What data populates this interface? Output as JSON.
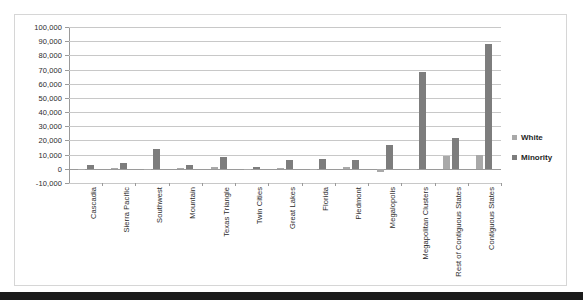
{
  "chart_data": {
    "type": "bar",
    "title": "",
    "subtitle": "",
    "xlabel": "",
    "ylabel": "",
    "ylim": [
      -10000,
      100000
    ],
    "ytick_step": 10000,
    "grid": true,
    "legend_position": "right",
    "yticks": [
      "100,000",
      "90,000",
      "80,000",
      "70,000",
      "60,000",
      "50,000",
      "40,000",
      "30,000",
      "20,000",
      "10,000",
      "0",
      "-10,000"
    ],
    "ytick_values": [
      100000,
      90000,
      80000,
      70000,
      60000,
      50000,
      40000,
      30000,
      20000,
      10000,
      0,
      -10000
    ],
    "categories": [
      "Cascadia",
      "Sierra Pacific",
      "Southwest",
      "Mountain",
      "Texas Triangle",
      "Twin Cities",
      "Great Lakes",
      "Florida",
      "Piedmont",
      "Megalopolis",
      "Megapolitan Clusters",
      "Rest of Contiguous States",
      "Contiguous States"
    ],
    "series": [
      {
        "name": "White",
        "color": "#a9a9a9",
        "values": [
          200,
          400,
          -600,
          700,
          1400,
          100,
          500,
          -100,
          1500,
          -2600,
          200,
          9300,
          9400
        ]
      },
      {
        "name": "Minority",
        "color": "#7d7d7d",
        "values": [
          2600,
          3900,
          13900,
          2500,
          8400,
          1000,
          6400,
          7100,
          6000,
          16700,
          68000,
          21400,
          88000
        ]
      }
    ]
  },
  "legend": {
    "items": [
      {
        "label": "White",
        "marker": "square-marker"
      },
      {
        "label": "Minority",
        "marker": "square-marker"
      }
    ]
  }
}
